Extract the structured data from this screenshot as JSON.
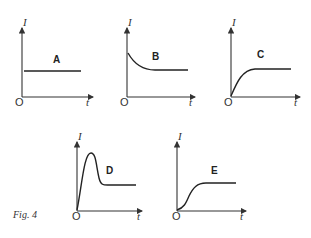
{
  "figure": {
    "caption": "Fig. 4",
    "y_axis_label": "I",
    "x_axis_label": "t",
    "origin_label": "O"
  },
  "panels": [
    {
      "id": "A",
      "label": "A",
      "shape": "constant"
    },
    {
      "id": "B",
      "label": "B",
      "shape": "initial spike decaying to constant"
    },
    {
      "id": "C",
      "label": "C",
      "shape": "rises from zero to plateau"
    },
    {
      "id": "D",
      "label": "D",
      "shape": "rises sharply to peak, falls, settles to constant"
    },
    {
      "id": "E",
      "label": "E",
      "shape": "S-shaped rise from zero to plateau"
    }
  ]
}
